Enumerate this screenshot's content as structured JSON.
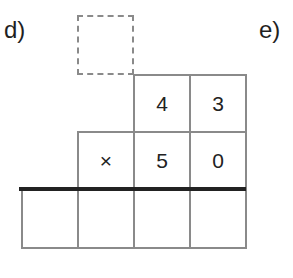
{
  "labels": {
    "left": "d)",
    "right": "e)"
  },
  "problem": {
    "carry_box": "",
    "row1": [
      "",
      "",
      "4",
      "3"
    ],
    "row2": [
      "",
      "×",
      "5",
      "0"
    ],
    "result": [
      "",
      "",
      "",
      ""
    ]
  }
}
